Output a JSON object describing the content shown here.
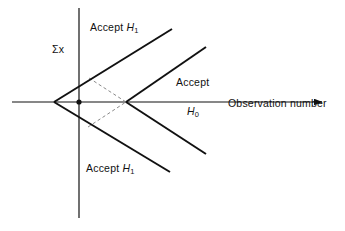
{
  "figure": {
    "caption_absent": true,
    "background_color": "#ffffff",
    "line_color": "#111111",
    "dashed_color": "#8a8a8a"
  },
  "axes": {
    "x_axis": {
      "label": "Observation number",
      "has_arrow": true,
      "arrow_direction": "right",
      "start_px": 12,
      "end_px": 327,
      "y_px": 102
    },
    "y_axis": {
      "label": "Σx",
      "has_arrow": false,
      "x_px": 79,
      "top_px": 8,
      "bottom_px": 218
    }
  },
  "labels": {
    "accept_h1_upper": {
      "text": "Accept",
      "hypothesis": "H",
      "subscript": "1"
    },
    "accept_h1_lower": {
      "text": "Accept",
      "hypothesis": "H",
      "subscript": "1"
    },
    "accept_h0": {
      "text": "Accept",
      "hypothesis": "H",
      "subscript": "0"
    },
    "sum_x": "Σx",
    "observation_number": "Observation number"
  },
  "chart_data": {
    "type": "line",
    "title": "",
    "xlabel": "Observation number",
    "ylabel": "Σx",
    "grid": false,
    "legend": "none",
    "origin_px": {
      "x": 79,
      "y": 102
    },
    "markers": [
      {
        "name": "left-vertex",
        "x_px": 54,
        "y_px": 102
      },
      {
        "name": "origin-dot",
        "x_px": 79,
        "y_px": 102
      },
      {
        "name": "right-vertex",
        "x_px": 126,
        "y_px": 102
      }
    ],
    "series": [
      {
        "name": "upper-boundary-left-wedge",
        "style": "solid",
        "points_px": [
          [
            54,
            102
          ],
          [
            172,
            29
          ]
        ]
      },
      {
        "name": "lower-boundary-left-wedge",
        "style": "solid",
        "points_px": [
          [
            54,
            102
          ],
          [
            170,
            172
          ]
        ]
      },
      {
        "name": "upper-boundary-right-wedge",
        "style": "solid",
        "points_px": [
          [
            126,
            102
          ],
          [
            206,
            47
          ]
        ]
      },
      {
        "name": "lower-boundary-right-wedge",
        "style": "solid",
        "points_px": [
          [
            126,
            102
          ],
          [
            206,
            154
          ]
        ]
      },
      {
        "name": "dashed-upper-connector",
        "style": "dashed",
        "points_px": [
          [
            89,
            78
          ],
          [
            126,
            102
          ]
        ]
      },
      {
        "name": "dashed-lower-connector",
        "style": "dashed",
        "points_px": [
          [
            88,
            127
          ],
          [
            126,
            102
          ]
        ]
      }
    ]
  }
}
